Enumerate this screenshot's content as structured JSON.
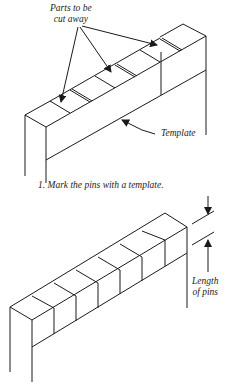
{
  "figure": {
    "top_diagram": {
      "label_parts": [
        "Parts to be",
        "cut away"
      ],
      "label_template": "Template"
    },
    "caption": "1. Mark the pins with a template.",
    "bottom_diagram": {
      "label_length": [
        "Length",
        "of pins"
      ]
    },
    "colors": {
      "line": "#1a1a1a",
      "background": "#ffffff"
    }
  }
}
